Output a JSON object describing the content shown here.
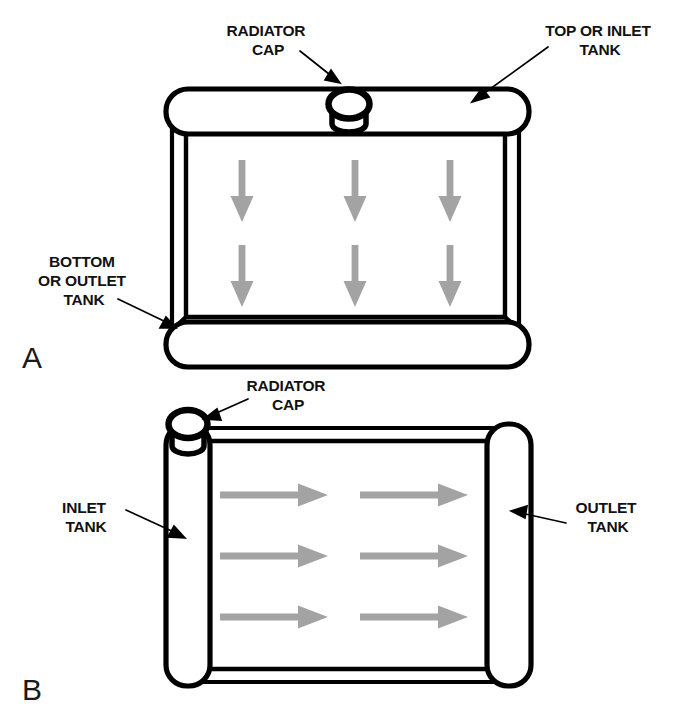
{
  "figure": {
    "background_color": "#ffffff",
    "line_color": "#000000",
    "arrow_color": "#a3a3a3",
    "panels": [
      {
        "letter": "A",
        "letter_x": 22,
        "letter_y": 368,
        "flow_type": "downflow",
        "description": "Downflow radiator with top inlet tank and bottom outlet tank",
        "labels": [
          {
            "name": "radiator-cap",
            "lines": [
              "RADIATOR",
              "CAP"
            ],
            "text_x": 268,
            "text_y": 36,
            "line_height": 19,
            "anchor": "middle",
            "leader": {
              "x1": 300,
              "y1": 51,
              "x2": 337,
              "y2": 80
            }
          },
          {
            "name": "top-or-inlet-tank",
            "lines": [
              "TOP OR INLET",
              "TANK"
            ],
            "text_x": 600,
            "text_y": 36,
            "line_height": 19,
            "anchor": "middle",
            "leader": {
              "x1": 546,
              "y1": 48,
              "x2": 475,
              "y2": 100
            }
          },
          {
            "name": "bottom-or-outlet-tank",
            "lines": [
              "BOTTOM",
              "OR OUTLET",
              "TANK"
            ],
            "text_x": 84,
            "text_y": 267,
            "line_height": 19,
            "anchor": "middle",
            "leader": {
              "x1": 120,
              "y1": 300,
              "x2": 172,
              "y2": 326
            }
          }
        ],
        "arrows": {
          "direction": "down",
          "columns_x": [
            242,
            355,
            450
          ],
          "rows_y": [
            160,
            245
          ],
          "length": 62,
          "count": 6
        }
      },
      {
        "letter": "B",
        "letter_x": 22,
        "letter_y": 700,
        "flow_type": "crossflow",
        "description": "Crossflow radiator with left inlet tank and right outlet tank",
        "labels": [
          {
            "name": "radiator-cap",
            "lines": [
              "RADIATOR",
              "CAP"
            ],
            "text_x": 288,
            "text_y": 391,
            "line_height": 19,
            "anchor": "middle",
            "leader": {
              "x1": 245,
              "y1": 400,
              "x2": 208,
              "y2": 418
            }
          },
          {
            "name": "inlet-tank",
            "lines": [
              "INLET",
              "TANK"
            ],
            "text_x": 86,
            "text_y": 513,
            "line_height": 19,
            "anchor": "middle",
            "leader": {
              "x1": 128,
              "y1": 512,
              "x2": 178,
              "y2": 535
            }
          },
          {
            "name": "outlet-tank",
            "lines": [
              "OUTLET",
              "TANK"
            ],
            "text_x": 608,
            "text_y": 513,
            "line_height": 19,
            "anchor": "middle",
            "leader": {
              "x1": 564,
              "y1": 522,
              "x2": 515,
              "y2": 515
            }
          }
        ],
        "arrows": {
          "direction": "right",
          "rows_y": [
            495,
            556,
            617
          ],
          "columns_x": [
            220,
            360
          ],
          "length": 108,
          "count": 6
        }
      }
    ]
  }
}
